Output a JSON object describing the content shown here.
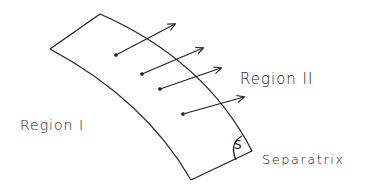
{
  "diagram": {
    "labels": {
      "region_two": "Region II",
      "region_one": "Region I",
      "separatrix": "Separatrix",
      "angle_mark": "S"
    },
    "stroke_color": "#222222",
    "background": "#ffffff",
    "band": {
      "description": "Curved band (separatrix surface) with four flux arrows crossing its outer edge from Region I into Region II"
    },
    "arrows": [
      {
        "from": [
          116,
          55
        ],
        "to": [
          175,
          24
        ]
      },
      {
        "from": [
          142,
          74
        ],
        "to": [
          203,
          48
        ]
      },
      {
        "from": [
          160,
          89
        ],
        "to": [
          221,
          68
        ]
      },
      {
        "from": [
          183,
          114
        ],
        "to": [
          244,
          97
        ]
      }
    ]
  }
}
